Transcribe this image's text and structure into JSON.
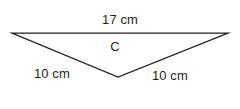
{
  "figure": {
    "kind": "geometry-diagram",
    "shape": "triangle",
    "background_color": "#ffffff",
    "stroke_color": "#231f20",
    "text_color": "#231f20",
    "vertices": {
      "top_left": {
        "x": 12,
        "y": 33
      },
      "top_right": {
        "x": 228,
        "y": 33
      },
      "bottom": {
        "x": 118,
        "y": 77
      }
    },
    "labels": {
      "top_side": "17 cm",
      "interior_vertex": "C",
      "left_side": "10 cm",
      "right_side": "10 cm"
    }
  }
}
